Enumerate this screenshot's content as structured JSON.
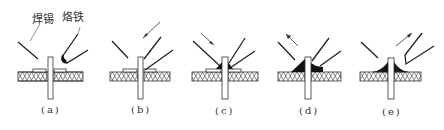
{
  "figure": {
    "annotations": {
      "solder": "焊锡",
      "iron": "烙铁"
    },
    "panels": [
      {
        "id": "a",
        "label": "(a)",
        "cx": 50,
        "step": "position solder and iron",
        "arrow": "none",
        "fillet": "none"
      },
      {
        "id": "b",
        "label": "(b)",
        "cx": 140,
        "step": "apply iron",
        "arrow": "down-left",
        "fillet": "none"
      },
      {
        "id": "c",
        "label": "(c)",
        "cx": 224,
        "step": "feed solder",
        "arrow": "down-right",
        "fillet": "small"
      },
      {
        "id": "d",
        "label": "(d)",
        "cx": 308,
        "step": "remove solder",
        "arrow": "up-left",
        "fillet": "full"
      },
      {
        "id": "e",
        "label": "(e)",
        "cx": 391,
        "step": "remove iron",
        "arrow": "up-right",
        "fillet": "cone"
      }
    ],
    "colors": {
      "line": "#222222",
      "solder_fill": "#111111",
      "board_hatch": "#444444",
      "background": "#ffffff"
    }
  }
}
